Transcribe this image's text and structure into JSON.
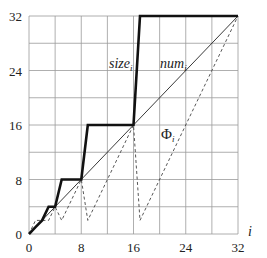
{
  "chart_data": {
    "type": "line",
    "title": "",
    "xlabel": "i",
    "ylabel": "",
    "xlim": [
      0,
      32
    ],
    "ylim": [
      0,
      32
    ],
    "grid": true,
    "x_ticks": [
      0,
      8,
      16,
      24,
      32
    ],
    "y_ticks": [
      0,
      8,
      16,
      24,
      32
    ],
    "grid_step": 4,
    "series": [
      {
        "name": "size_i",
        "style": "thick-solid",
        "points": [
          [
            0,
            0
          ],
          [
            1,
            1
          ],
          [
            2,
            2
          ],
          [
            3,
            4
          ],
          [
            4,
            4
          ],
          [
            5,
            8
          ],
          [
            8,
            8
          ],
          [
            9,
            16
          ],
          [
            16,
            16
          ],
          [
            17,
            32
          ],
          [
            32,
            32
          ]
        ]
      },
      {
        "name": "num_i",
        "style": "thin-solid",
        "points": [
          [
            0,
            0
          ],
          [
            32,
            32
          ]
        ]
      },
      {
        "name": "Phi_i",
        "style": "dashed",
        "points": [
          [
            0,
            0
          ],
          [
            1,
            2
          ],
          [
            2,
            2
          ],
          [
            3,
            2
          ],
          [
            4,
            4
          ],
          [
            5,
            2
          ],
          [
            8,
            8
          ],
          [
            9,
            2
          ],
          [
            16,
            16
          ],
          [
            17,
            2
          ],
          [
            32,
            32
          ]
        ]
      }
    ],
    "annotations": [
      {
        "text": "size",
        "sub": "i",
        "x": 14,
        "y": 27
      },
      {
        "text": "num",
        "sub": "i",
        "x": 22,
        "y": 27
      },
      {
        "text": "Φ",
        "sub": "i",
        "x": 18.5,
        "y": 14
      }
    ]
  },
  "labels": {
    "xlabel": "i",
    "size": "size",
    "size_sub": "i",
    "num": "num",
    "num_sub": "i",
    "phi": "Φ",
    "phi_sub": "i"
  }
}
